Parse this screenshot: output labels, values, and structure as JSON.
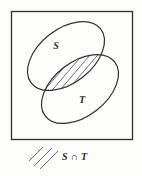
{
  "figure": {
    "type": "venn-diagram",
    "universe_box": {
      "x": 11,
      "y": 11,
      "width": 122,
      "height": 129,
      "stroke": "#2e2e2e"
    },
    "sets": [
      {
        "id": "S",
        "label": "S",
        "label_x": 56,
        "label_y": 49,
        "cx": 66,
        "cy": 56,
        "rx": 44,
        "ry": 27,
        "rotation": -38
      },
      {
        "id": "T",
        "label": "T",
        "label_x": 82,
        "label_y": 103,
        "cx": 80,
        "cy": 89,
        "rx": 44,
        "ry": 27,
        "rotation": -38
      }
    ],
    "intersection": {
      "label": "S ∩ T",
      "hatched": true,
      "hatch_direction": "lower-left-to-upper-right",
      "hatch_line_count": 8,
      "stroke": "#3a3a3a"
    },
    "legend": {
      "label": "S ∩ T",
      "label_x": 62,
      "label_y": 160,
      "swatch_strokes": 3,
      "swatch_x": 30,
      "swatch_y": 145
    },
    "colors": {
      "ink": "#2b2b2b",
      "line": "#2e2e2e",
      "hatch": "#4a4a4a",
      "background": "#fdfdfc"
    }
  }
}
